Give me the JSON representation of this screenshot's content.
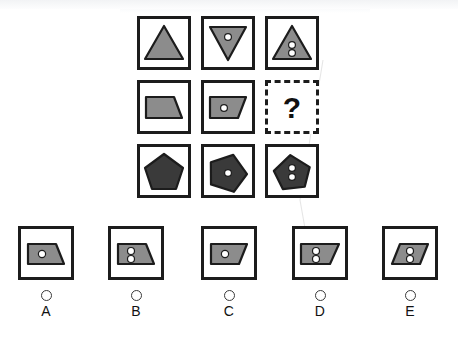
{
  "puzzle": {
    "type": "matrix-reasoning",
    "missing_cell_label": "?",
    "colors": {
      "shape_light_gray": "#8c8c8c",
      "shape_dark_gray": "#3a3a3a",
      "outline": "#1c1c1c",
      "dot_fill": "#ffffff",
      "background": "#ffffff"
    },
    "matrix": {
      "rows": 3,
      "columns": 3,
      "cells": [
        {
          "id": "r1c1",
          "shape": "triangle-up",
          "fill": "light",
          "dots": 0,
          "row": 1,
          "col": 1
        },
        {
          "id": "r1c2",
          "shape": "triangle-down",
          "fill": "light",
          "dots": 1,
          "row": 1,
          "col": 2
        },
        {
          "id": "r1c3",
          "shape": "triangle-up",
          "fill": "light",
          "dots": 2,
          "row": 1,
          "col": 3
        },
        {
          "id": "r2c1",
          "shape": "trapezoid",
          "fill": "light",
          "dots": 0,
          "row": 2,
          "col": 1
        },
        {
          "id": "r2c2",
          "shape": "trapezoid",
          "fill": "light",
          "dots": 1,
          "row": 2,
          "col": 2
        },
        {
          "id": "r2c3",
          "shape": "missing",
          "fill": "none",
          "dots": null,
          "row": 2,
          "col": 3
        },
        {
          "id": "r3c1",
          "shape": "pentagon",
          "fill": "dark",
          "dots": 0,
          "row": 3,
          "col": 1
        },
        {
          "id": "r3c2",
          "shape": "pentagon",
          "fill": "dark",
          "dots": 1,
          "row": 3,
          "col": 2
        },
        {
          "id": "r3c3",
          "shape": "pentagon",
          "fill": "dark",
          "dots": 2,
          "row": 3,
          "col": 3
        }
      ]
    },
    "options": [
      {
        "letter": "A",
        "shape": "trapezoid",
        "fill": "light",
        "dots": 1,
        "selected": false
      },
      {
        "letter": "B",
        "shape": "trapezoid",
        "fill": "light",
        "dots": 2,
        "selected": false
      },
      {
        "letter": "C",
        "shape": "trapezoid",
        "fill": "light",
        "dots": 1,
        "selected": false
      },
      {
        "letter": "D",
        "shape": "trapezoid",
        "fill": "light",
        "dots": 2,
        "selected": false
      },
      {
        "letter": "E",
        "shape": "parallelogram",
        "fill": "light",
        "dots": 2,
        "selected": false
      }
    ]
  }
}
